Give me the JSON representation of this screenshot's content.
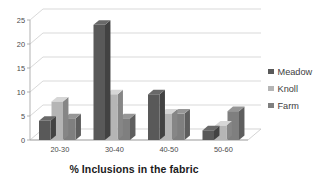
{
  "chart_data": {
    "type": "bar",
    "title": "",
    "subtitle": "",
    "xlabel": "% Inclusions in the fabric",
    "ylabel": "",
    "categories": [
      "20-30",
      "30-40",
      "40-50",
      "50-60"
    ],
    "series": [
      {
        "name": "Meadow",
        "color": "#595959",
        "values": [
          4,
          24,
          9.5,
          2
        ]
      },
      {
        "name": "Knoll",
        "color": "#b5b5b5",
        "values": [
          8,
          9.5,
          5.5,
          3
        ]
      },
      {
        "name": "Farm",
        "color": "#7f7f7f",
        "values": [
          4.5,
          4.5,
          5.5,
          6
        ]
      }
    ],
    "ylim": [
      0,
      25
    ],
    "yticks": [
      0,
      5,
      10,
      15,
      20,
      25
    ],
    "ytick_labels": [
      "0",
      "5",
      "10",
      "15",
      "20",
      "25"
    ],
    "grid": true,
    "grid_axis": "y",
    "legend": true,
    "legend_position": "right",
    "style": "3d-clustered-column"
  },
  "axis": {
    "x_title": "% Inclusions in the fabric",
    "y_tick_labels": [
      "25",
      "20",
      "15",
      "10",
      "5",
      "0"
    ],
    "category_labels": [
      "20-30",
      "30-40",
      "40-50",
      "50-60"
    ]
  },
  "legend": {
    "items": [
      {
        "label": "Meadow",
        "color": "#595959"
      },
      {
        "label": "Knoll",
        "color": "#b5b5b5"
      },
      {
        "label": "Farm",
        "color": "#7f7f7f"
      }
    ]
  },
  "colors": {
    "meadow": "#595959",
    "knoll": "#b5b5b5",
    "farm": "#7f7f7f",
    "gridline": "#c9c9c9",
    "axis": "#a8a8a8",
    "text": "#4a4a4a",
    "title_text": "#1b1b1b",
    "background": "#ffffff"
  }
}
